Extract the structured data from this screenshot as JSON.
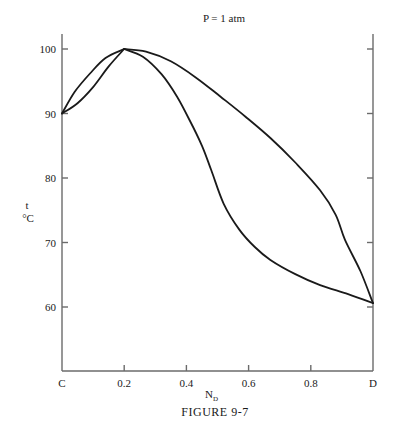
{
  "chart_data": {
    "type": "line",
    "title": "P = 1 atm",
    "xlabel": "N",
    "xlabel_subscript": "D",
    "ylabel": "t",
    "ylabel_unit": "°C",
    "caption": "FIGURE 9-7",
    "xlim": [
      0,
      1
    ],
    "ylim": [
      51,
      102.5
    ],
    "x_ticks": [
      {
        "value": 0,
        "label": "C"
      },
      {
        "value": 0.2,
        "label": "0.2"
      },
      {
        "value": 0.4,
        "label": "0.4"
      },
      {
        "value": 0.6,
        "label": "0.6"
      },
      {
        "value": 0.8,
        "label": "0.8"
      },
      {
        "value": 1.0,
        "label": "D"
      }
    ],
    "y_ticks": [
      {
        "value": 60,
        "label": "60"
      },
      {
        "value": 70,
        "label": "70"
      },
      {
        "value": 80,
        "label": "80"
      },
      {
        "value": 90,
        "label": "90"
      },
      {
        "value": 100,
        "label": "100"
      }
    ],
    "grid": false,
    "legend": null,
    "annotations": [
      {
        "text": "azeotrope (maximum boiling)",
        "x": 0.2,
        "y": 100,
        "shown": false
      }
    ],
    "series": [
      {
        "name": "vapor (dew-point) curve",
        "x": [
          0,
          0.04,
          0.09,
          0.14,
          0.2,
          0.27,
          0.35,
          0.43,
          0.51,
          0.59,
          0.67,
          0.75,
          0.83,
          0.88,
          0.91,
          0.96,
          1.0
        ],
        "y": [
          90,
          93.3,
          96.2,
          98.6,
          100,
          99.6,
          98.1,
          95.6,
          92.6,
          89.5,
          86.2,
          82.4,
          78.1,
          74.3,
          70.4,
          65.5,
          60.6
        ]
      },
      {
        "name": "liquid (bubble-point) curve",
        "x": [
          0,
          0.05,
          0.1,
          0.15,
          0.2,
          0.26,
          0.32,
          0.37,
          0.41,
          0.45,
          0.48,
          0.52,
          0.57,
          0.62,
          0.67,
          0.75,
          0.83,
          0.92,
          1.0
        ],
        "y": [
          90,
          91.6,
          94.1,
          97.3,
          100,
          98.8,
          96.1,
          92.6,
          89.0,
          85.0,
          81.2,
          76.0,
          72.0,
          69.3,
          67.3,
          65.1,
          63.4,
          62.0,
          60.6
        ]
      }
    ]
  }
}
